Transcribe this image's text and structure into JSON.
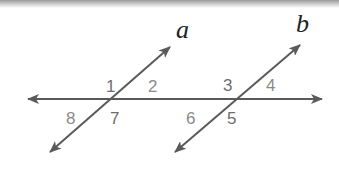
{
  "figure": {
    "line_color": "#5a5a5a",
    "horizontal_line": {
      "x1": 28,
      "y1": 99,
      "x2": 322,
      "y2": 99
    },
    "lines": [
      {
        "name": "a",
        "label": "a",
        "x1": 50,
        "y1": 152,
        "x2": 170,
        "y2": 47,
        "label_x": 176,
        "label_y": 38
      },
      {
        "name": "b",
        "label": "b",
        "x1": 175,
        "y1": 152,
        "x2": 300,
        "y2": 45,
        "label_x": 296,
        "label_y": 32
      }
    ],
    "angles": [
      {
        "label": "1",
        "x": 106,
        "y": 92
      },
      {
        "label": "2",
        "x": 148,
        "y": 92
      },
      {
        "label": "3",
        "x": 223,
        "y": 91
      },
      {
        "label": "4",
        "x": 266,
        "y": 91
      },
      {
        "label": "5",
        "x": 227,
        "y": 124
      },
      {
        "label": "6",
        "x": 186,
        "y": 124
      },
      {
        "label": "7",
        "x": 110,
        "y": 124
      },
      {
        "label": "8",
        "x": 66,
        "y": 124
      }
    ]
  }
}
